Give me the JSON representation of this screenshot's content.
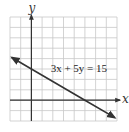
{
  "chart_data": {
    "type": "line",
    "title": "",
    "equation_label": "3x + 5y = 15",
    "xlabel": "x",
    "ylabel": "y",
    "xlim": [
      -2,
      8
    ],
    "ylim": [
      -2,
      8
    ],
    "grid": true,
    "grid_step": 1,
    "tick_labels": false,
    "series": [
      {
        "name": "3x + 5y = 15",
        "x": [
          -1.83,
          0,
          5,
          7.8
        ],
        "y": [
          4.1,
          3,
          0,
          -1.68
        ],
        "arrows_both_ends": true,
        "intercepts": {
          "y_intercept": [
            0,
            3
          ],
          "x_intercept": [
            5,
            0
          ]
        }
      }
    ],
    "colors": {
      "grid": "#c8c8c8",
      "axis": "#333333",
      "line": "#333333"
    }
  }
}
